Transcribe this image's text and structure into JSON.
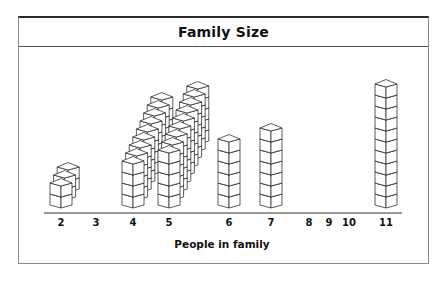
{
  "chart_data": {
    "type": "pictograph",
    "title": "Family Size",
    "xlabel": "People in family",
    "ylabel": "",
    "categories": [
      "2",
      "3",
      "4",
      "5",
      "6",
      "7",
      "8",
      "9",
      "10",
      "11"
    ],
    "values": [
      3,
      0,
      9,
      9,
      1,
      1,
      0,
      0,
      0,
      1
    ],
    "series": [
      {
        "name": "Number of families (stacks of cubes, each cube = 1 person)",
        "values": [
          3,
          0,
          9,
          9,
          1,
          1,
          0,
          0,
          0,
          1
        ]
      }
    ],
    "tick_x": [
      61,
      96,
      133,
      169,
      229,
      271,
      309,
      329,
      349,
      386
    ],
    "grid": false,
    "legend": null
  }
}
